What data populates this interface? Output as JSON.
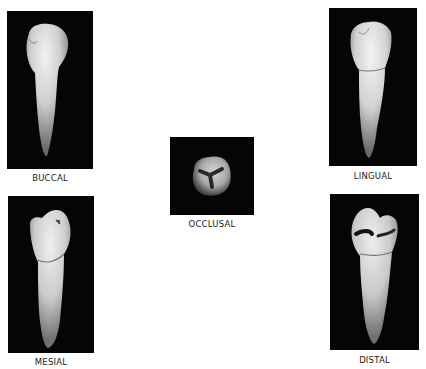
{
  "figure": {
    "views": [
      {
        "id": "buccal",
        "label": "BUCCAL"
      },
      {
        "id": "lingual",
        "label": "LINGUAL"
      },
      {
        "id": "occlusal",
        "label": "OCCLUSAL"
      },
      {
        "id": "mesial",
        "label": "MESIAL"
      },
      {
        "id": "distal",
        "label": "DISTAL"
      }
    ]
  }
}
